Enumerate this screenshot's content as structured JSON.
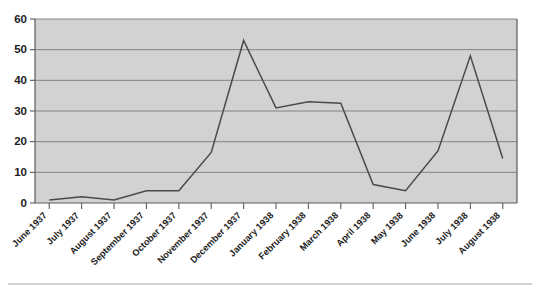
{
  "chart_data": {
    "type": "line",
    "title": "",
    "subtitle": "",
    "xlabel": "",
    "ylabel": "",
    "categories": [
      "June 1937",
      "July 1937",
      "August 1937",
      "September 1937",
      "October 1937",
      "November 1937",
      "December 1937",
      "January 1938",
      "February 1938",
      "March 1938",
      "April 1938",
      "May 1938",
      "June 1938",
      "July 1938",
      "August 1938"
    ],
    "values": [
      1,
      2,
      1,
      4,
      4,
      16.5,
      53,
      31,
      33,
      32.5,
      6,
      4,
      17,
      48,
      14.5
    ],
    "yticks": [
      0,
      10,
      20,
      30,
      40,
      50,
      60
    ],
    "ytick_labels": [
      "0",
      "10",
      "20",
      "30",
      "40",
      "50",
      "60"
    ],
    "ylim": [
      0,
      60
    ],
    "xlim_index": [
      0,
      14
    ],
    "grid": true,
    "grid_axis": "y",
    "legend": false,
    "legend_position": "none",
    "series": [
      {
        "name": "series-1",
        "values": [
          1,
          2,
          1,
          4,
          4,
          16.5,
          53,
          31,
          33,
          32.5,
          6,
          4,
          17,
          48,
          14.5
        ]
      }
    ],
    "colors": {
      "plot_background": "#d2d2d2",
      "line": "#4a4a4a",
      "gridline": "#6e6e6e",
      "axis": "#5a5a5a",
      "text": "#1c1c1c",
      "page_background": "#ffffff"
    }
  }
}
